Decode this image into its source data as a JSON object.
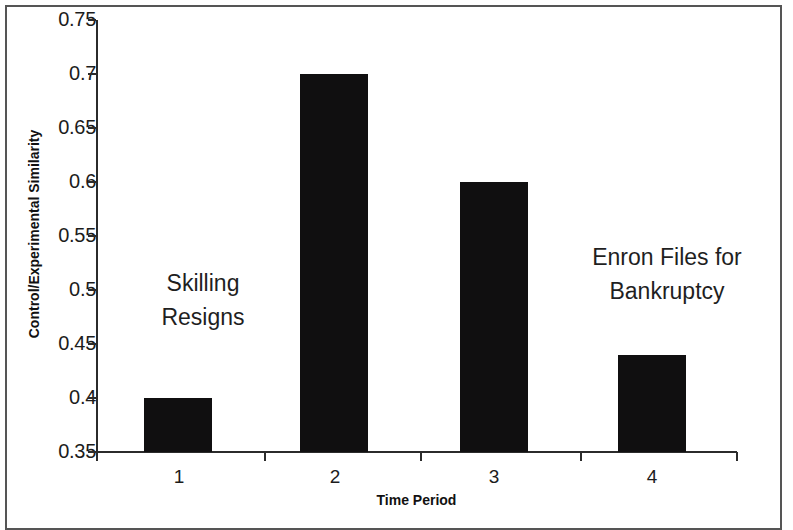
{
  "chart_data": {
    "type": "bar",
    "title": "",
    "subtitle": "",
    "xlabel": "Time Period",
    "ylabel": "Control/Experimental Similarity",
    "categories": [
      "1",
      "2",
      "3",
      "4"
    ],
    "values": [
      0.4,
      0.7,
      0.6,
      0.44
    ],
    "series": [
      {
        "name": "Control/Experimental Similarity",
        "values": [
          0.4,
          0.7,
          0.6,
          0.44
        ]
      }
    ],
    "ylim": [
      0.35,
      0.75
    ],
    "ytick_step": 0.05,
    "yticks": [
      "0.75",
      "0.7",
      "0.65",
      "0.6",
      "0.55",
      "0.5",
      "0.45",
      "0.4",
      "0.35"
    ],
    "ytick_values": [
      0.75,
      0.7,
      0.65,
      0.6,
      0.55,
      0.5,
      0.45,
      0.4,
      0.35
    ],
    "xticks": [
      "1",
      "2",
      "3",
      "4"
    ],
    "grid": false,
    "legend": false,
    "legend_position": "none",
    "bar_color": "#100f10",
    "axis_color": "#2b2b2b",
    "background_color": "#ffffff",
    "annotations": [
      {
        "id": "skilling",
        "lines": [
          "Skilling",
          "Resigns"
        ],
        "line1": "Skilling",
        "line2": "Resigns",
        "near_category": "1",
        "approx_y_value": 0.49
      },
      {
        "id": "bankruptcy",
        "lines": [
          "Enron Files for",
          "Bankruptcy"
        ],
        "line1": "Enron Files for",
        "line2": "Bankruptcy",
        "near_category": "4",
        "approx_y_value": 0.53
      }
    ]
  }
}
